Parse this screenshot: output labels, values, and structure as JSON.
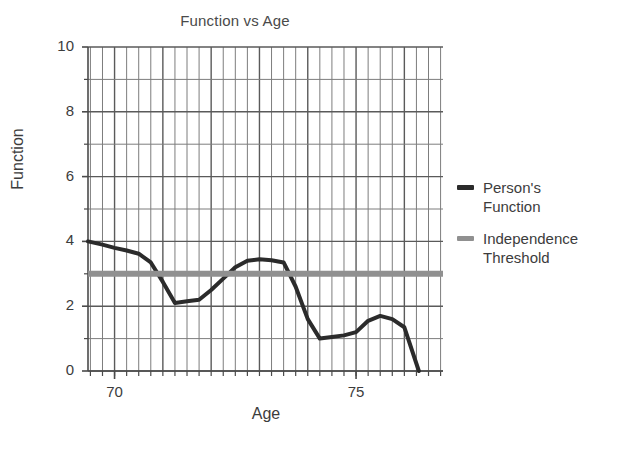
{
  "chart_data": {
    "type": "line",
    "title": "Function vs Age",
    "xlabel": "Age",
    "ylabel": "Function",
    "xlim": [
      69.45,
      76.8
    ],
    "ylim": [
      0,
      10
    ],
    "xticks": [
      70,
      75
    ],
    "xtick_labels": [
      "70",
      "75"
    ],
    "yticks": [
      0,
      2,
      4,
      6,
      8,
      10
    ],
    "ytick_labels": [
      "0",
      "2",
      "4",
      "6",
      "8",
      "10"
    ],
    "grid": "major and minor gridlines on both axes",
    "minor_x_step": 0.25,
    "minor_y_step": 1,
    "legend_position": "right outside",
    "series": [
      {
        "name": "Person's Function",
        "legend_label": "Person's\nFunction",
        "color": "#2b2b2b",
        "linewidth": 4,
        "x": [
          69.45,
          69.75,
          70.0,
          70.25,
          70.5,
          70.75,
          71.0,
          71.25,
          71.5,
          71.75,
          72.0,
          72.25,
          72.5,
          72.75,
          73.0,
          73.25,
          73.5,
          73.75,
          74.0,
          74.25,
          74.5,
          74.75,
          75.0,
          75.25,
          75.5,
          75.75,
          76.0,
          76.3
        ],
        "y": [
          4.0,
          3.9,
          3.8,
          3.72,
          3.62,
          3.35,
          2.75,
          2.1,
          2.15,
          2.2,
          2.5,
          2.85,
          3.2,
          3.4,
          3.45,
          3.42,
          3.35,
          2.6,
          1.6,
          1.0,
          1.05,
          1.1,
          1.2,
          1.55,
          1.7,
          1.6,
          1.35,
          0.0
        ]
      },
      {
        "name": "Independence Threshold",
        "legend_label": "Independence\nThreshold",
        "color": "#909090",
        "linewidth": 6,
        "type": "horizontal-line",
        "value": 3.0
      }
    ]
  },
  "colors": {
    "background": "#ffffff",
    "axis": "#4a4a4a",
    "grid_major": "#5a5a5a",
    "grid_minor": "#7d7d7d",
    "person_function": "#2b2b2b",
    "independence_threshold": "#909090",
    "text": "#3c3c3c"
  }
}
